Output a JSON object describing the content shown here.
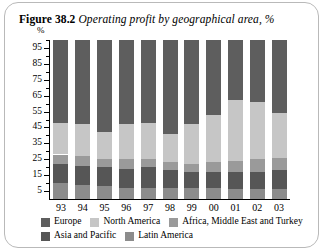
{
  "figure": {
    "number": "Figure 38.2",
    "caption": "Operating profit by geographical area, %"
  },
  "chart_data": {
    "type": "bar",
    "stacked": true,
    "stack_percent": true,
    "title": "Operating profit by geographical area, %",
    "xlabel": "",
    "ylabel": "%",
    "unit_label": "%",
    "ylim": [
      0,
      100
    ],
    "yticks": [
      5,
      15,
      25,
      35,
      45,
      55,
      65,
      75,
      85,
      95
    ],
    "ytick_labels": [
      "5",
      "15",
      "25",
      "35",
      "45",
      "55",
      "65",
      "75",
      "85",
      "95"
    ],
    "minor_yticks": [
      10,
      20,
      30,
      40,
      50,
      60,
      70,
      80,
      90,
      100
    ],
    "grid": false,
    "legend_position": "bottom",
    "categories": [
      "93",
      "94",
      "95",
      "96",
      "97",
      "98",
      "99",
      "00",
      "01",
      "02",
      "03"
    ],
    "series": [
      {
        "name": "Europe",
        "color": "#5e5e5e",
        "values": [
          52,
          53,
          58,
          53,
          52,
          59,
          53,
          47,
          38,
          39,
          46
        ]
      },
      {
        "name": "North America",
        "color": "#c6c6c6",
        "values": [
          20,
          20,
          17,
          22,
          23,
          18,
          25,
          30,
          38,
          36,
          28
        ]
      },
      {
        "name": "Africa, Middle East and Turkey",
        "color": "#9a9a9a",
        "values": [
          6,
          6,
          5,
          6,
          5,
          5,
          5,
          6,
          7,
          8,
          8
        ]
      },
      {
        "name": "Asia and Pacific",
        "color": "#565656",
        "values": [
          12,
          12,
          12,
          12,
          13,
          11,
          10,
          10,
          11,
          11,
          12
        ]
      },
      {
        "name": "Latin America",
        "color": "#8c8c8c",
        "values": [
          10,
          9,
          8,
          7,
          7,
          7,
          7,
          7,
          6,
          6,
          6
        ]
      }
    ]
  },
  "legend": {
    "row1": [
      "Europe",
      "North America",
      "Africa, Middle East and Turkey"
    ],
    "row2": [
      "Asia and Pacific",
      "Latin America"
    ]
  },
  "colors": {
    "europe": "#5e5e5e",
    "north_america": "#c6c6c6",
    "africa_me_turkey": "#9a9a9a",
    "asia_pacific": "#565656",
    "latin_america": "#8c8c8c",
    "card_border": "#b9b9b9",
    "axis": "#000000"
  }
}
